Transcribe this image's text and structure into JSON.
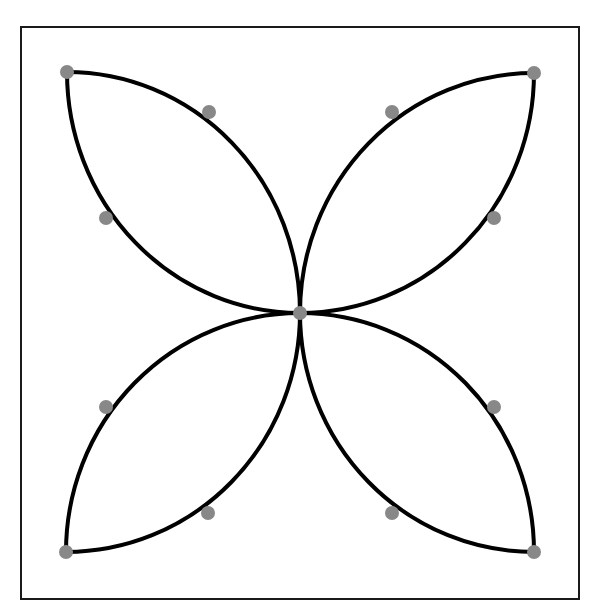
{
  "diagram": {
    "type": "four-petal curve figure",
    "frame": {
      "x": 21,
      "y": 27,
      "width": 558,
      "height": 572,
      "stroke": "#1a1a1a"
    },
    "center": {
      "x": 300,
      "y": 313
    },
    "corners": {
      "top_left": {
        "x": 67,
        "y": 72
      },
      "top_right": {
        "x": 534,
        "y": 73
      },
      "bottom_left": {
        "x": 66,
        "y": 552
      },
      "bottom_right": {
        "x": 534,
        "y": 552
      }
    },
    "midpoints": [
      {
        "x": 209,
        "y": 112
      },
      {
        "x": 106,
        "y": 218
      },
      {
        "x": 392,
        "y": 112
      },
      {
        "x": 494,
        "y": 218
      },
      {
        "x": 106,
        "y": 407
      },
      {
        "x": 208,
        "y": 513
      },
      {
        "x": 494,
        "y": 407
      },
      {
        "x": 392,
        "y": 513
      }
    ],
    "colors": {
      "curve": "#000000",
      "point": "#888888",
      "background": "#ffffff"
    },
    "point_radius": 7,
    "curve_width": 4
  }
}
